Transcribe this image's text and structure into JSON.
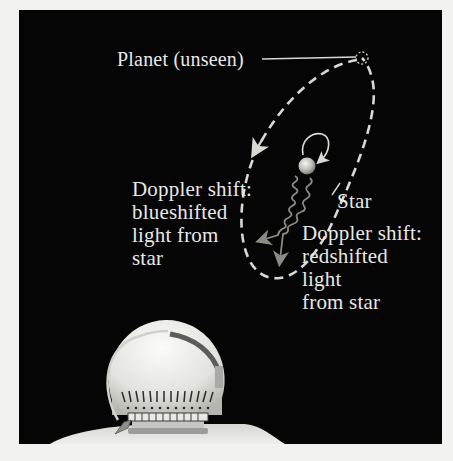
{
  "diagram": {
    "labels": {
      "planet": "Planet (unseen)",
      "star": "Star",
      "blueshift": {
        "heading": "Doppler shift:",
        "lines": [
          "blueshifted",
          "light from",
          "star"
        ]
      },
      "redshift": {
        "heading": "Doppler shift:",
        "lines": [
          "redshifted",
          "light",
          "from star"
        ]
      }
    },
    "elements": {
      "planet_marker": "dashed-circle",
      "orbit": "dashed-ellipse-with-arrow",
      "star_wobble": "small-loop-arrow",
      "light_rays": [
        "wavy-arrow-blueshifted",
        "wavy-arrow-redshifted"
      ],
      "observatory": "telescope-dome"
    },
    "colors": {
      "background": "#050505",
      "text": "#e8e8e4",
      "orbit": "#d8d8d4",
      "rays": "#8a8a86",
      "dome": "#e6e6e2",
      "page": "#f2f2f0"
    },
    "caption_cut_off": ""
  }
}
